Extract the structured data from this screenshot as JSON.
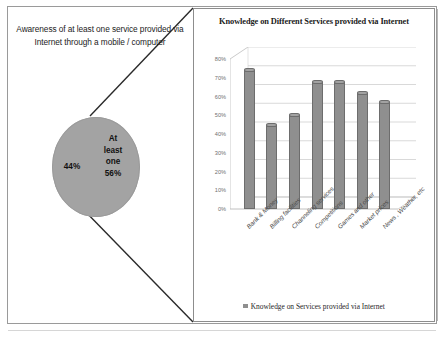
{
  "figure": {
    "callout": {
      "text": "Awareness of at least one service provided via Internet through a mobile / computer"
    },
    "pie": {
      "type": "pie",
      "title": "Awareness of at least one service provided via Internet through a mobile / computer",
      "slices": [
        {
          "label": "At least one",
          "value": 56,
          "value_label": "56%",
          "color": "#a3a3a3"
        },
        {
          "label": "",
          "value": 44,
          "value_label": "44%",
          "color": "#a3a3a3"
        }
      ],
      "major_label": "At least one 56%",
      "major_label_line1": "At",
      "major_label_line2": "least",
      "major_label_line3": "one",
      "major_label_line4": "56%",
      "minor_label": "44%"
    }
  },
  "chart_data": {
    "type": "bar",
    "title": "Knowledge on Different Services provided via Internet",
    "xlabel": "",
    "ylabel": "",
    "ylim": [
      0,
      80
    ],
    "ytick_labels": [
      "80%",
      "70%",
      "60%",
      "50%",
      "40%",
      "30%",
      "20%",
      "10%",
      "0%"
    ],
    "ytick_values": [
      80,
      70,
      60,
      50,
      40,
      30,
      20,
      10,
      0
    ],
    "grid": true,
    "legend_position": "bottom",
    "categories": [
      "Bank & Money",
      "Billing facilities",
      "Channeling services",
      "Competitions",
      "Games and other",
      "Market prices",
      "News , Weather, etc"
    ],
    "series": [
      {
        "name": "Knowledge on Services provided via Internet",
        "color": "#8f8f8f",
        "values": [
          74,
          45,
          50,
          68,
          68,
          62,
          57
        ]
      }
    ],
    "legend": [
      "Knowledge on Services provided via Internet"
    ]
  },
  "colors": {
    "bar": "#8f8f8f",
    "pie": "#a3a3a3",
    "frame": "#9a9a9a",
    "grid": "#c8c8c8",
    "text": "#1c1c1c"
  }
}
